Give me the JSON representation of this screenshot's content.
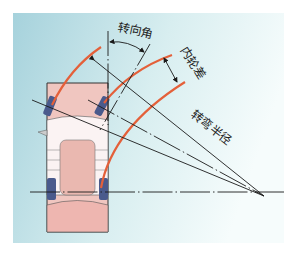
{
  "diagram": {
    "labels": {
      "steering_angle": "转向角",
      "inner_wheel_difference": "内轮差",
      "turning_radius": "转弯半径"
    },
    "colors": {
      "background_left": "#a6d2dc",
      "background_right": "#f4fbfb",
      "track_curve": "#e4603a",
      "car_body": "#f0c6c0",
      "wheel": "#4a5a8c",
      "line": "#1a1a1a"
    }
  }
}
